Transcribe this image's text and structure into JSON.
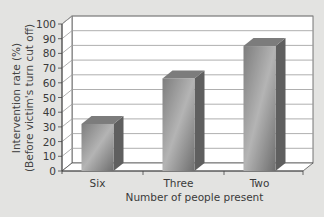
{
  "chart_data": {
    "type": "bar",
    "style": "3d-column",
    "title": "",
    "xlabel": "Number of people present",
    "ylabel": "Intervention rate (%)",
    "ylabel_line2": "(Before victim's turn cut off)",
    "categories": [
      "Six",
      "Three",
      "Two"
    ],
    "values": [
      32,
      63,
      85
    ],
    "ylim": [
      0,
      100
    ],
    "yticks": [
      "0",
      "10",
      "20",
      "30",
      "40",
      "50",
      "60",
      "70",
      "80",
      "90",
      "100"
    ],
    "grid": true,
    "legend": null,
    "colors": {
      "background": "#e3e3e1",
      "wall": "#ffffff",
      "bar_front": "#8e8e8e",
      "bar_side": "#5f5f5f",
      "bar_top": "#7c7c7c",
      "grid": "#9a9a9a"
    }
  }
}
